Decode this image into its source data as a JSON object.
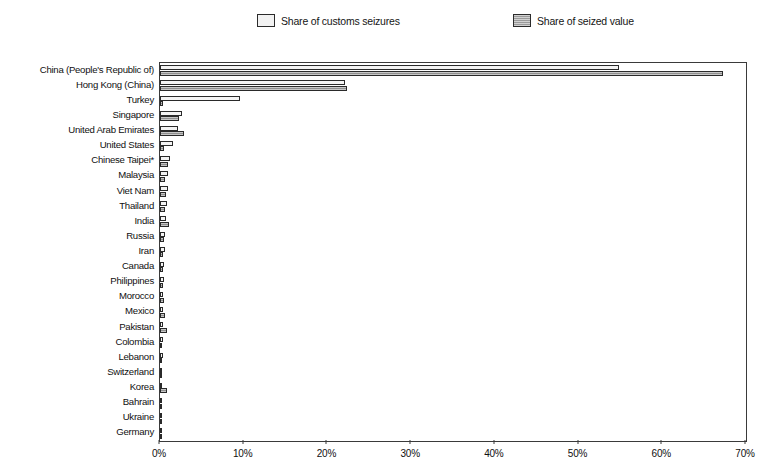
{
  "legend": {
    "position": "top",
    "entries": [
      {
        "label": "Share of customs seizures",
        "swatch": "light-square-icon",
        "color": "#f4f4f4"
      },
      {
        "label": "Share of seized value",
        "swatch": "hatched-square-icon",
        "color": "#8f8f8f"
      }
    ]
  },
  "axis": {
    "x_tick_labels": [
      "0%",
      "10%",
      "20%",
      "30%",
      "40%",
      "50%",
      "60%",
      "70%"
    ]
  },
  "chart_data": {
    "type": "bar",
    "orientation": "horizontal",
    "title": "",
    "subtitle": "",
    "xlabel": "",
    "ylabel": "",
    "xlim": [
      0,
      70
    ],
    "xticks": [
      0,
      10,
      20,
      30,
      40,
      50,
      60,
      70
    ],
    "xtick_labels": [
      "0%",
      "10%",
      "20%",
      "30%",
      "40%",
      "50%",
      "60%",
      "70%"
    ],
    "grid": false,
    "legend_position": "top",
    "units": "percent",
    "categories": [
      "China (People's Republic of)",
      "Hong Kong (China)",
      "Turkey",
      "Singapore",
      "United Arab Emirates",
      "United States",
      "Chinese Taipei*",
      "Malaysia",
      "Viet Nam",
      "Thailand",
      "India",
      "Russia",
      "Iran",
      "Canada",
      "Philippines",
      "Morocco",
      "Mexico",
      "Pakistan",
      "Colombia",
      "Lebanon",
      "Switzerland",
      "Korea",
      "Bahrain",
      "Ukraine",
      "Germany"
    ],
    "series": [
      {
        "name": "Share of customs seizures",
        "color": "#f4f4f4",
        "values": [
          54.8,
          22.1,
          9.6,
          2.6,
          2.1,
          1.6,
          1.2,
          1.0,
          0.9,
          0.8,
          0.7,
          0.6,
          0.6,
          0.5,
          0.5,
          0.4,
          0.4,
          0.4,
          0.3,
          0.3,
          0.2,
          0.2,
          0.2,
          0.2,
          0.1
        ]
      },
      {
        "name": "Share of seized value",
        "color": "#8f8f8f",
        "values": [
          67.3,
          22.3,
          0.4,
          2.3,
          2.9,
          0.5,
          0.9,
          0.6,
          0.7,
          0.6,
          1.1,
          0.5,
          0.4,
          0.3,
          0.4,
          0.5,
          0.6,
          0.8,
          0.2,
          0.2,
          0.2,
          0.8,
          0.2,
          0.2,
          0.2
        ]
      }
    ],
    "footnote": ""
  }
}
